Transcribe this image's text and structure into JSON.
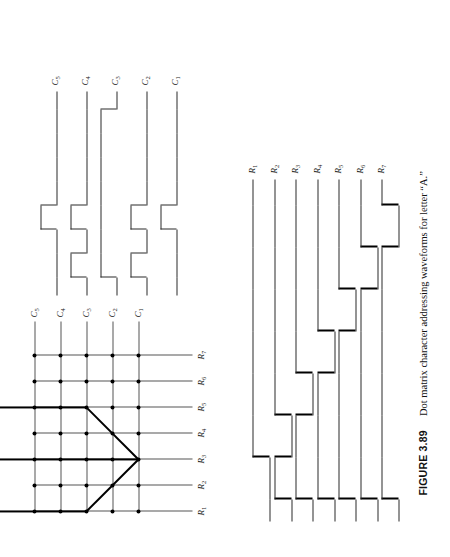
{
  "figure": {
    "number_label": "FIGURE 3.89",
    "caption_text": "Dot matrix character addressing waveforms for letter “A.”",
    "character": "A",
    "rotation_degrees": -90,
    "ink_color": "#000000",
    "grid_color": "#555555",
    "background": "#ffffff"
  },
  "dot_matrix": {
    "title": "dot matrix grid",
    "rows": 7,
    "columns": 5,
    "row_labels": [
      "R1",
      "R2",
      "R3",
      "R4",
      "R5",
      "R6",
      "R7"
    ],
    "column_labels": [
      "C1",
      "C2",
      "C3",
      "C4",
      "C5"
    ],
    "row_label_parts": [
      {
        "base": "R",
        "sub": "1"
      },
      {
        "base": "R",
        "sub": "2"
      },
      {
        "base": "R",
        "sub": "3"
      },
      {
        "base": "R",
        "sub": "4"
      },
      {
        "base": "R",
        "sub": "5"
      },
      {
        "base": "R",
        "sub": "6"
      },
      {
        "base": "R",
        "sub": "7"
      }
    ],
    "column_label_parts": [
      {
        "base": "C",
        "sub": "1"
      },
      {
        "base": "C",
        "sub": "2"
      },
      {
        "base": "C",
        "sub": "3"
      },
      {
        "base": "C",
        "sub": "4"
      },
      {
        "base": "C",
        "sub": "5"
      }
    ],
    "character_strokes": [
      {
        "name": "apex-left-up",
        "from_row": 3,
        "from_col": 1,
        "to_row": 1,
        "to_col": 3
      },
      {
        "name": "apex-left-down",
        "from_row": 3,
        "from_col": 1,
        "to_row": 5,
        "to_col": 3
      },
      {
        "name": "top-bar",
        "from_row": 1,
        "from_col": 3,
        "to_row": 1,
        "to_col": 7
      },
      {
        "name": "bottom-bar",
        "from_row": 5,
        "from_col": 3,
        "to_row": 5,
        "to_col": 7
      },
      {
        "name": "cross-bar",
        "from_row": 3,
        "from_col": 1,
        "to_row": 3,
        "to_col": 7
      }
    ]
  },
  "column_waveforms": {
    "title": "column addressing waveforms",
    "signal_labels": [
      "C1",
      "C2",
      "C3",
      "C4",
      "C5"
    ],
    "label_parts": [
      {
        "base": "C",
        "sub": "1"
      },
      {
        "base": "C",
        "sub": "2"
      },
      {
        "base": "C",
        "sub": "3"
      },
      {
        "base": "C",
        "sub": "4"
      },
      {
        "base": "C",
        "sub": "5"
      }
    ],
    "time_slots": 7,
    "note": "Each column line carries the dot pattern for that column across the 7 row scan times.",
    "patterns": [
      {
        "signal": "C1",
        "bits": [
          0,
          0,
          1,
          0,
          0,
          0,
          0
        ]
      },
      {
        "signal": "C2",
        "bits": [
          1,
          0,
          1,
          0,
          0,
          0,
          0
        ]
      },
      {
        "signal": "C3",
        "bits": [
          1,
          1,
          1,
          1,
          1,
          1,
          1
        ]
      },
      {
        "signal": "C4",
        "bits": [
          1,
          0,
          1,
          0,
          0,
          0,
          0
        ]
      },
      {
        "signal": "C5",
        "bits": [
          0,
          0,
          1,
          0,
          0,
          0,
          0
        ]
      }
    ]
  },
  "row_waveforms": {
    "title": "row scan waveforms",
    "signal_labels": [
      "R1",
      "R2",
      "R3",
      "R4",
      "R5",
      "R6",
      "R7"
    ],
    "label_parts": [
      {
        "base": "R",
        "sub": "1"
      },
      {
        "base": "R",
        "sub": "2"
      },
      {
        "base": "R",
        "sub": "3"
      },
      {
        "base": "R",
        "sub": "4"
      },
      {
        "base": "R",
        "sub": "5"
      },
      {
        "base": "R",
        "sub": "6"
      },
      {
        "base": "R",
        "sub": "7"
      }
    ],
    "time_slots": 7,
    "note": "Sequential one-of-seven row scan: each row is pulsed active for one time slot in order.",
    "patterns": [
      {
        "signal": "R1",
        "active_slot": 1
      },
      {
        "signal": "R2",
        "active_slot": 2
      },
      {
        "signal": "R3",
        "active_slot": 3
      },
      {
        "signal": "R4",
        "active_slot": 4
      },
      {
        "signal": "R5",
        "active_slot": 5
      },
      {
        "signal": "R6",
        "active_slot": 6
      },
      {
        "signal": "R7",
        "active_slot": 7
      }
    ]
  }
}
